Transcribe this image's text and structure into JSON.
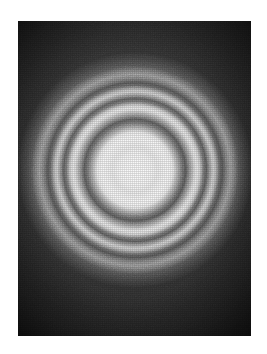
{
  "figure": {
    "kind": "diffraction-ring-photograph",
    "caption": "",
    "plate": {
      "background_color": "#111111",
      "border_color": "#2a2a2a",
      "left": 18,
      "top": 21,
      "width": 233,
      "height": 315
    },
    "pattern": {
      "center_x_pct": 50.2,
      "center_y_pct": 47.3,
      "outer_radius_px": 118,
      "ring_count": 4,
      "core_color": "#f4f4f4",
      "dark_ring_color": "#333333",
      "background_color": "#0b0b0b"
    }
  },
  "chart_data": {
    "type": "line",
    "xlabel": "Radius (px from pattern center)",
    "ylabel": "Relative intensity (0-255 grayscale)",
    "xlim": [
      0,
      118
    ],
    "ylim": [
      0,
      255
    ],
    "grid": false,
    "legend_position": "none",
    "x": [
      0,
      9,
      17,
      22,
      28,
      33,
      38,
      42,
      47,
      51,
      55,
      60,
      64,
      68,
      72,
      75,
      79,
      84,
      88,
      92,
      96,
      100,
      104,
      108,
      112,
      118
    ],
    "series": [
      {
        "name": "radial intensity",
        "values": [
          242,
          244,
          239,
          226,
          240,
          246,
          234,
          154,
          77,
          51,
          142,
          216,
          230,
          198,
          90,
          58,
          138,
          200,
          180,
          76,
          51,
          110,
          140,
          106,
          58,
          20
        ]
      }
    ],
    "annotations": [
      {
        "label": "central bright disk",
        "radius_px": 0,
        "intensity": 244
      },
      {
        "label": "1st dark ring",
        "radius_px": 47,
        "intensity": 51
      },
      {
        "label": "1st bright ring",
        "radius_px": 60,
        "intensity": 230
      },
      {
        "label": "2nd dark ring",
        "radius_px": 71,
        "intensity": 58
      },
      {
        "label": "2nd bright ring",
        "radius_px": 79,
        "intensity": 200
      },
      {
        "label": "3rd dark ring",
        "radius_px": 92,
        "intensity": 51
      },
      {
        "label": "3rd bright ring (faint)",
        "radius_px": 100,
        "intensity": 140
      }
    ]
  }
}
